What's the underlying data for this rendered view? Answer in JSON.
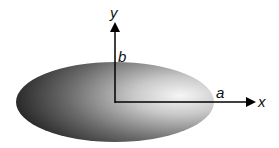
{
  "diagram": {
    "type": "ellipse-axes",
    "labels": {
      "x_axis": "x",
      "y_axis": "y",
      "semi_major": "a",
      "semi_minor": "b"
    },
    "colors": {
      "ellipse_dark": "#111111",
      "ellipse_light": "#f4f4f4",
      "axes": "#000000",
      "background": "#ffffff"
    }
  }
}
